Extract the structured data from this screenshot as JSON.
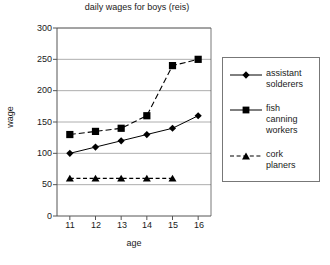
{
  "chart_data": {
    "type": "line",
    "title": "daily wages for boys (reis)",
    "xlabel": "age",
    "ylabel": "wage",
    "categories": [
      11,
      12,
      13,
      14,
      15,
      16
    ],
    "x": [
      11,
      12,
      13,
      14,
      15,
      16
    ],
    "xlim": [
      10.5,
      16.5
    ],
    "ylim": [
      0,
      300
    ],
    "yticks": [
      0,
      50,
      100,
      150,
      200,
      250,
      300
    ],
    "xticks": [
      11,
      12,
      13,
      14,
      15,
      16
    ],
    "grid": "horizontal",
    "legend_position": "right",
    "series": [
      {
        "name": "assistant solderers",
        "marker": "diamond",
        "linestyle": "solid",
        "color": "#000000",
        "x": [
          11,
          12,
          13,
          14,
          15,
          16
        ],
        "values": [
          100,
          110,
          120,
          130,
          140,
          160
        ]
      },
      {
        "name": "fish canning workers",
        "marker": "square",
        "linestyle": "dashed",
        "color": "#000000",
        "x": [
          11,
          12,
          13,
          14,
          15,
          16
        ],
        "values": [
          130,
          135,
          140,
          160,
          240,
          250
        ]
      },
      {
        "name": "cork planers",
        "marker": "triangle",
        "linestyle": "dashed",
        "color": "#000000",
        "x": [
          11,
          12,
          13,
          14,
          15
        ],
        "values": [
          60,
          60,
          60,
          60,
          60
        ]
      }
    ]
  },
  "axis": {
    "ytick_labels": [
      "300",
      "250",
      "200",
      "150",
      "100",
      "50",
      "0"
    ],
    "xtick_labels": [
      "11",
      "12",
      "13",
      "14",
      "15",
      "16"
    ]
  },
  "legend": {
    "entries": [
      {
        "label_line1": "assistant",
        "label_line2": "solderers",
        "label_line3": ""
      },
      {
        "label_line1": "fish",
        "label_line2": "canning",
        "label_line3": "workers"
      },
      {
        "label_line1": "cork",
        "label_line2": "planers",
        "label_line3": ""
      }
    ]
  },
  "colors": {
    "axis": "#555555",
    "grid": "#999999",
    "series": "#000000",
    "background": "#ffffff"
  }
}
